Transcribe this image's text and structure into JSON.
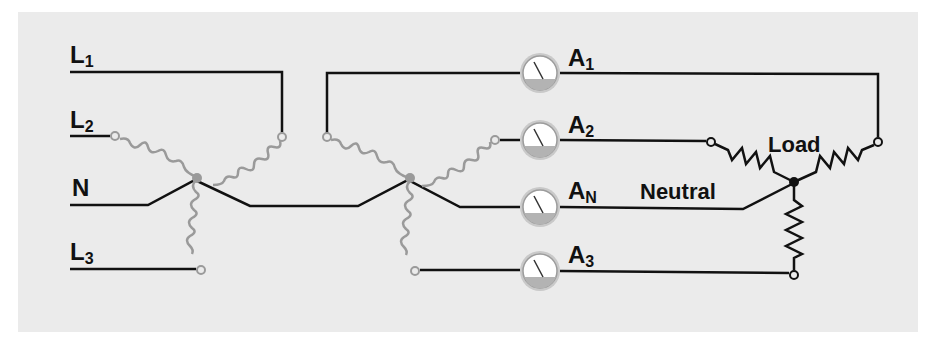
{
  "diagram": {
    "type": "three-phase wye-connected transformer feeding wye-connected load with ammeters",
    "colors": {
      "panel": "#ebebeb",
      "wire": "#111111",
      "coil": "#9a9a9a",
      "meter_face": "#ffffff",
      "meter_rim": "#a8a8a8",
      "meter_base": "#b5b5b5"
    },
    "source_labels": {
      "l1": "L",
      "l1_sub": "1",
      "l2": "L",
      "l2_sub": "2",
      "n": "N",
      "l3": "L",
      "l3_sub": "3"
    },
    "meters": [
      {
        "name": "A",
        "sub": "1"
      },
      {
        "name": "A",
        "sub": "2"
      },
      {
        "name": "A",
        "sub": "N"
      },
      {
        "name": "A",
        "sub": "3"
      }
    ],
    "load_label": "Load",
    "neutral_label": "Neutral"
  }
}
